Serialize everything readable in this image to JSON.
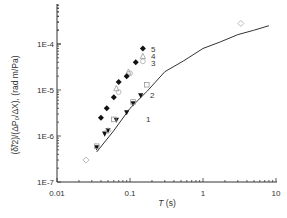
{
  "chart_data": {
    "type": "scatter",
    "title": "",
    "xlabel": "T (s)",
    "ylabel": "(δ̃/2)/(ΔP0/ΔX), (rad m/Pa)",
    "xscale": "log",
    "yscale": "log",
    "xlim": [
      0.01,
      10
    ],
    "ylim": [
      1e-07,
      0.001
    ],
    "x_ticks": [
      "0.01",
      "0.1",
      "1",
      "10"
    ],
    "y_ticks": [
      "1E-7",
      "1E-6",
      "1E-5",
      "1E-4"
    ],
    "grid": false,
    "legend": "inline numeric labels 1–5 next to series",
    "series": [
      {
        "name": "1",
        "marker": "filled-triangle-down",
        "x": [
          0.035,
          0.045,
          0.05,
          0.065,
          0.09,
          0.11,
          0.14
        ],
        "y": [
          5.5e-07,
          1.1e-06,
          1.3e-06,
          2.2e-06,
          3.2e-06,
          5e-06,
          7.5e-06
        ]
      },
      {
        "name": "2",
        "marker": "open-square",
        "x": [
          0.035,
          0.06,
          0.11,
          0.17
        ],
        "y": [
          6e-07,
          2.3e-06,
          5.5e-06,
          1.3e-05
        ]
      },
      {
        "name": "3",
        "marker": "open-circle",
        "x": [
          0.07,
          0.1,
          0.15
        ],
        "y": [
          9e-06,
          2.3e-05,
          4.2e-05
        ]
      },
      {
        "name": "4",
        "marker": "open-triangle",
        "x": [
          0.065,
          0.095,
          0.15
        ],
        "y": [
          1.1e-05,
          2.5e-05,
          5.5e-05
        ]
      },
      {
        "name": "5",
        "marker": "filled-diamond",
        "x": [
          0.04,
          0.048,
          0.06,
          0.07,
          0.09,
          0.12,
          0.15
        ],
        "y": [
          2.5e-06,
          4e-06,
          7e-06,
          1.5e-05,
          2e-05,
          4e-05,
          8e-05
        ]
      },
      {
        "name": "open-diamond",
        "marker": "open-diamond",
        "x": [
          0.025,
          0.05,
          3.3
        ],
        "y": [
          3e-07,
          1.3e-06,
          0.00028
        ]
      },
      {
        "name": "model-curve",
        "marker": "line",
        "x": [
          0.035,
          0.1,
          0.3,
          1,
          3,
          8
        ],
        "y": [
          4.5e-07,
          4e-06,
          2.5e-05,
          8e-05,
          0.00016,
          0.00025
        ]
      }
    ]
  }
}
